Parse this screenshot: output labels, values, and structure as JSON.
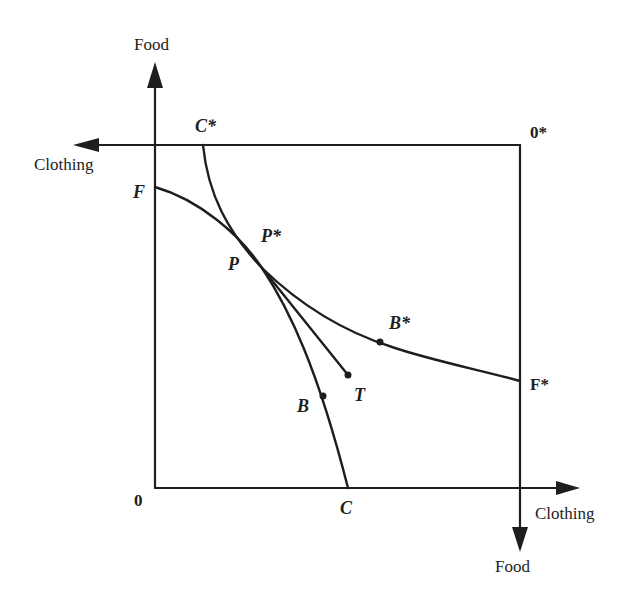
{
  "diagram": {
    "type": "edgeworth-box-production-possibility",
    "axes": {
      "home_food_label": "Food",
      "home_clothing_label": "Clothing",
      "foreign_clothing_label": "Clothing",
      "foreign_food_label": "Food",
      "origin_home": "0",
      "origin_foreign": "0*"
    },
    "points": {
      "F": "F",
      "C": "C",
      "C_star": "C*",
      "F_star": "F*",
      "P": "P",
      "P_star": "P*",
      "B": "B",
      "B_star": "B*",
      "T": "T"
    },
    "curves": [
      {
        "name": "home-ppf",
        "from": "F",
        "to": "C",
        "through": [
          "P",
          "B"
        ]
      },
      {
        "name": "foreign-ppf",
        "from": "C*",
        "to": "F*",
        "through": [
          "P*",
          "B*"
        ]
      },
      {
        "name": "trade-line",
        "from": "P",
        "to": "T"
      }
    ],
    "colors": {
      "ink": "#1e1e1e",
      "background": "#ffffff"
    }
  }
}
